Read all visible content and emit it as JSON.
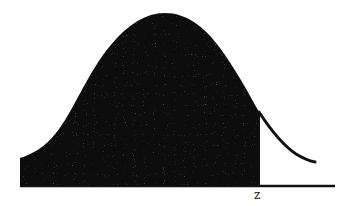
{
  "diagram": {
    "type": "normal-distribution-shaded-area",
    "label_z": "z",
    "colors": {
      "shade": "#0a0a0a",
      "curve": "#111111",
      "baseline": "#111111",
      "background": "#ffffff"
    }
  }
}
